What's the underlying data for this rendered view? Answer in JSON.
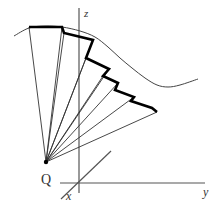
{
  "diagram": {
    "labels": {
      "point": "Q",
      "axis_z": "z",
      "axis_y": "y",
      "axis_x": "x"
    },
    "colors": {
      "background": "#ffffff",
      "axes": "#555555",
      "rays": "#333333",
      "curve": "#444444",
      "staircase": "#000000",
      "point": "#000000"
    },
    "point_Q": [
      46,
      162
    ],
    "axes": {
      "z": {
        "from": [
          79,
          8
        ],
        "to": [
          79,
          193
        ]
      },
      "y": {
        "from": [
          60,
          183
        ],
        "to": [
          205,
          183
        ]
      },
      "x": {
        "from": [
          61,
          199
        ],
        "to": [
          111,
          151
        ]
      }
    },
    "curve_points": [
      [
        14,
        36
      ],
      [
        29,
        28
      ],
      [
        45,
        26
      ],
      [
        62,
        27
      ],
      [
        80,
        31
      ],
      [
        95,
        37
      ],
      [
        108,
        47
      ],
      [
        120,
        58
      ],
      [
        132,
        68
      ],
      [
        145,
        78
      ],
      [
        157,
        85
      ],
      [
        168,
        87
      ],
      [
        180,
        85
      ],
      [
        198,
        79
      ]
    ],
    "staircase_points": [
      [
        29,
        27
      ],
      [
        62,
        27
      ],
      [
        64,
        33
      ],
      [
        93,
        40
      ],
      [
        86,
        58
      ],
      [
        109,
        69
      ],
      [
        103,
        76
      ],
      [
        118,
        83
      ],
      [
        115,
        90
      ],
      [
        134,
        97
      ],
      [
        131,
        101
      ],
      [
        140,
        104
      ],
      [
        152,
        108
      ],
      [
        157,
        112
      ]
    ],
    "ray_targets": [
      [
        29,
        27
      ],
      [
        62,
        27
      ],
      [
        64,
        33
      ],
      [
        93,
        40
      ],
      [
        86,
        58
      ],
      [
        109,
        69
      ],
      [
        103,
        76
      ],
      [
        118,
        83
      ],
      [
        134,
        97
      ],
      [
        157,
        112
      ]
    ]
  }
}
